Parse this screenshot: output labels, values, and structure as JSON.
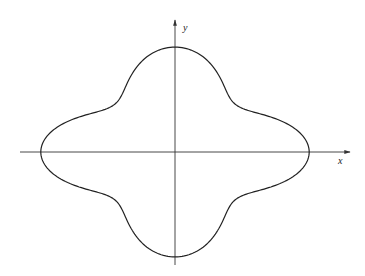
{
  "diagram": {
    "title": "",
    "axes": {
      "x_label": "x",
      "y_label": "y",
      "origin_px": [
        175,
        152
      ],
      "x_axis_px": [
        20,
        350
      ],
      "y_axis_px": [
        20,
        265
      ]
    },
    "curve": {
      "description": "closed four-lobed curve symmetric about both axes",
      "type": "polar",
      "equation_form": "r = 1 + k cos(4θ)",
      "k": 0.22,
      "scale_px": [
        110,
        86
      ],
      "intercepts_px": {
        "left": 42,
        "right": 310,
        "top": 47,
        "bottom": 257
      }
    },
    "colors": {
      "stroke": "#222222",
      "axis": "#333333",
      "background": "#ffffff"
    }
  }
}
